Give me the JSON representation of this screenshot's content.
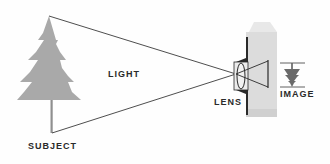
{
  "diagram": {
    "title": "",
    "labels": {
      "subject": "SUBJECT",
      "light": "LIGHT",
      "lens": "LENS",
      "image": "IMAGE"
    },
    "colors": {
      "tree": "#a9a9a9",
      "camera_body": "#dcdcdc",
      "camera_cap": "#e6e6e6",
      "lines": "#3a3a3a",
      "text": "#2a2a2a"
    },
    "icons": [
      "tree-icon",
      "camera-icon",
      "lens-icon",
      "inverted-tree-icon"
    ]
  }
}
